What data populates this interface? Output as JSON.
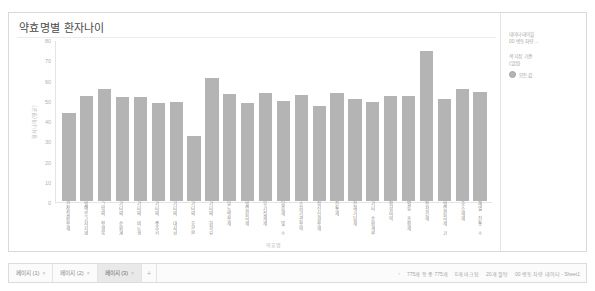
{
  "chart": {
    "title": "약효명별 환자나이",
    "ylabel": "환자나이(평균)",
    "xlabel": "약효명"
  },
  "legend": {
    "group_data_table": {
      "head": "데이터 테이블",
      "sub": "00 병동 차량 ..."
    },
    "group_color": {
      "head": "색 지정 기준:",
      "sub": "(없음)"
    },
    "items": [
      {
        "label": "모든 값",
        "color": "#b4b4b4"
      }
    ]
  },
  "bottom": {
    "tabs": [
      {
        "label": "페이지 (1)",
        "close": "×",
        "active": false
      },
      {
        "label": "페이지 (2)",
        "close": "×",
        "active": false
      },
      {
        "label": "페이지 (3)",
        "close": "×",
        "active": true
      }
    ],
    "add_tab": "+",
    "status": {
      "arrow": "‹",
      "rows": "775개 항 중 775개",
      "marked": "0개 마크됨",
      "filtered": "20개 필텅",
      "source": "00 병동 차량 데이터 - Sheet1"
    }
  },
  "chart_data": {
    "type": "bar",
    "title": "약효명별 환자나이",
    "xlabel": "약효명",
    "ylabel": "환자나이(평균)",
    "ylim": [
      0,
      80
    ],
    "yticks": [
      0,
      10,
      20,
      30,
      40,
      50,
      60,
      70,
      80
    ],
    "grid": false,
    "legend_position": "right",
    "bar_color": "#b4b4b4",
    "categories": [
      "간장질환용제",
      "혈액응고저지제",
      "그밖의 항생물질제제",
      "기타의 순환계용약",
      "기타의 비뇨생식기관 및 항문용약",
      "기타의 중추신경용약",
      "기타의 대사성의약품",
      "기타의 호르몬제",
      "기타의 화학요법제",
      "당뇨병용제",
      "혈압강하제",
      "무기질제제",
      "담즙제 및 소화기관용약",
      "소화기관용약",
      "정신신경용제",
      "진통제",
      "진해거담제",
      "기타 순환계용약",
      "합성마약",
      "별류 조합제",
      "항전간제",
      "혈압강하제 기타",
      "호소제제",
      "해열 진통 소염제"
    ],
    "values": [
      44,
      52.5,
      56,
      52,
      52,
      49,
      49.5,
      32.5,
      61.5,
      53.5,
      49,
      54,
      50,
      53,
      47.5,
      54,
      51,
      49.5,
      52.5,
      52.5,
      75,
      51,
      56,
      54.5
    ],
    "series": [
      {
        "name": "모든 값",
        "values": [
          44,
          52.5,
          56,
          52,
          52,
          49,
          49.5,
          32.5,
          61.5,
          53.5,
          49,
          54,
          50,
          53,
          47.5,
          54,
          51,
          49.5,
          52.5,
          52.5,
          75,
          51,
          56,
          54.5
        ]
      }
    ]
  }
}
